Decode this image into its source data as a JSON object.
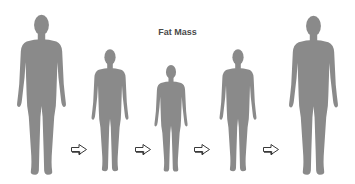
{
  "title": "Fat Mass",
  "colors": {
    "silhouette": "#8a8a8a",
    "arrow_stroke": "#3a3a3a",
    "background": "#ffffff",
    "title": "#4a4a4a"
  },
  "figures": [
    {
      "label": "figure-1",
      "size": "large",
      "x": 15,
      "y": 13,
      "w": 53,
      "h": 164
    },
    {
      "label": "figure-2",
      "size": "medium",
      "x": 90,
      "y": 48,
      "w": 40,
      "h": 125
    },
    {
      "label": "figure-3",
      "size": "small",
      "x": 153,
      "y": 64,
      "w": 36,
      "h": 109
    },
    {
      "label": "figure-4",
      "size": "medium",
      "x": 218,
      "y": 48,
      "w": 40,
      "h": 125
    },
    {
      "label": "figure-5",
      "size": "large",
      "x": 287,
      "y": 14,
      "w": 53,
      "h": 163
    }
  ],
  "arrows": [
    {
      "direction": "right",
      "x": 70,
      "y": 143
    },
    {
      "direction": "right",
      "x": 134,
      "y": 143
    },
    {
      "direction": "right",
      "x": 193,
      "y": 143
    },
    {
      "direction": "right",
      "x": 262,
      "y": 143
    }
  ]
}
